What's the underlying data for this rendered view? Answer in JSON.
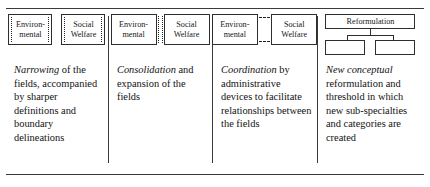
{
  "figure": {
    "panel_count": 4,
    "line_color": "#2e2e2e"
  },
  "panels": [
    {
      "id": "narrowing",
      "diagram": {
        "style": "two separate boxes with dotted inner edge marks",
        "boxes": [
          {
            "line1": "Environ-",
            "line2": "mental"
          },
          {
            "line1": "Social",
            "line2": "Welfare"
          }
        ]
      },
      "caption": {
        "lead": "Narrowing",
        "rest": " of the fields, accompanied by sharper definitions and boundary delineations"
      }
    },
    {
      "id": "consolidation",
      "diagram": {
        "style": "two adjacent boxes sharing a dotted seam",
        "boxes": [
          {
            "line1": "Environ-",
            "line2": "mental"
          },
          {
            "line1": "Social",
            "line2": "Welfare"
          }
        ]
      },
      "caption": {
        "lead": "Consolidation",
        "rest": " and expansion of the fields"
      }
    },
    {
      "id": "coordination",
      "diagram": {
        "style": "two boxes linked by short dashed connectors top and bottom",
        "boxes": [
          {
            "line1": "Environ-",
            "line2": "mental"
          },
          {
            "line1": "Social",
            "line2": "Welfare"
          }
        ]
      },
      "caption": {
        "lead": "Coordination",
        "rest": " by administrative devices to facilitate relationships between the fields"
      }
    },
    {
      "id": "reformulation",
      "diagram": {
        "style": "tree: one parent box branching to two empty child boxes",
        "parent_label": "Reformulation",
        "children": [
          "",
          ""
        ]
      },
      "caption": {
        "lead": "New conceptual",
        "rest": " reformulation and threshold in which new sub-specialties and categories are created"
      }
    }
  ]
}
